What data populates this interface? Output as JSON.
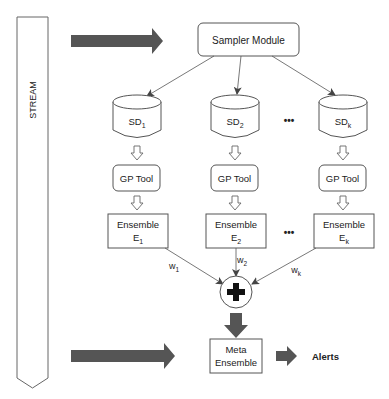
{
  "diagram": {
    "stream": {
      "label": "STREAM"
    },
    "sampler": {
      "label": "Sampler Module"
    },
    "subsets": [
      {
        "base": "SD",
        "sub": "1"
      },
      {
        "base": "SD",
        "sub": "2"
      },
      {
        "base": "SD",
        "sub": "k"
      }
    ],
    "gp_tools": [
      {
        "label": "GP Tool"
      },
      {
        "label": "GP Tool"
      },
      {
        "label": "GP Tool"
      }
    ],
    "ensembles": [
      {
        "line1": "Ensemble",
        "base": "E",
        "sub": "1"
      },
      {
        "line1": "Ensemble",
        "base": "E",
        "sub": "2"
      },
      {
        "line1": "Ensemble",
        "base": "E",
        "sub": "k"
      }
    ],
    "weights": [
      {
        "base": "w",
        "sub": "1"
      },
      {
        "base": "w",
        "sub": "2"
      },
      {
        "base": "w",
        "sub": "k"
      }
    ],
    "ellipsis": "•••",
    "combiner": {
      "symbol": "plus"
    },
    "meta": {
      "line1": "Meta",
      "line2": "Ensemble"
    },
    "output": {
      "label": "Alerts"
    },
    "colors": {
      "arrow_fill": "#555555",
      "stroke": "#444444"
    }
  }
}
